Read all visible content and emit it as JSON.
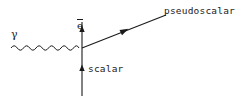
{
  "figure": {
    "type": "feynman-diagram",
    "width": 242,
    "height": 108,
    "background_color": "#ffffff",
    "stroke_color": "#1a1a1a"
  },
  "labels": {
    "photon": "γ",
    "antielectron_base": "e",
    "antielectron_full": "ē",
    "scalar": "scalar",
    "pseudoscalar": "pseudoscalar"
  },
  "diagram_elements": {
    "vertex": {
      "x": 82,
      "y": 48
    },
    "photon_line": {
      "name": "photon-wavy-line",
      "style": "wavy",
      "x_start": 11,
      "x_end": 82,
      "y": 48,
      "amplitude": 3.2,
      "period": 12.5
    },
    "positron_line": {
      "name": "positron-line",
      "style": "straight",
      "x": 82,
      "y_start": 48,
      "y_end": 22,
      "arrow_direction": "up",
      "arrow_at_y": 30
    },
    "scalar_line": {
      "name": "scalar-line",
      "style": "straight",
      "x": 82,
      "y_start": 96,
      "y_end": 48,
      "arrow_direction": "up",
      "arrow_at_y": 69
    },
    "pseudoscalar_line": {
      "name": "pseudoscalar-line",
      "style": "straight",
      "x_start": 82,
      "y_start": 48,
      "x_end": 166,
      "y_end": 15,
      "arrow_direction": "up-right",
      "arrow_at": {
        "x": 124,
        "y": 31
      }
    }
  }
}
